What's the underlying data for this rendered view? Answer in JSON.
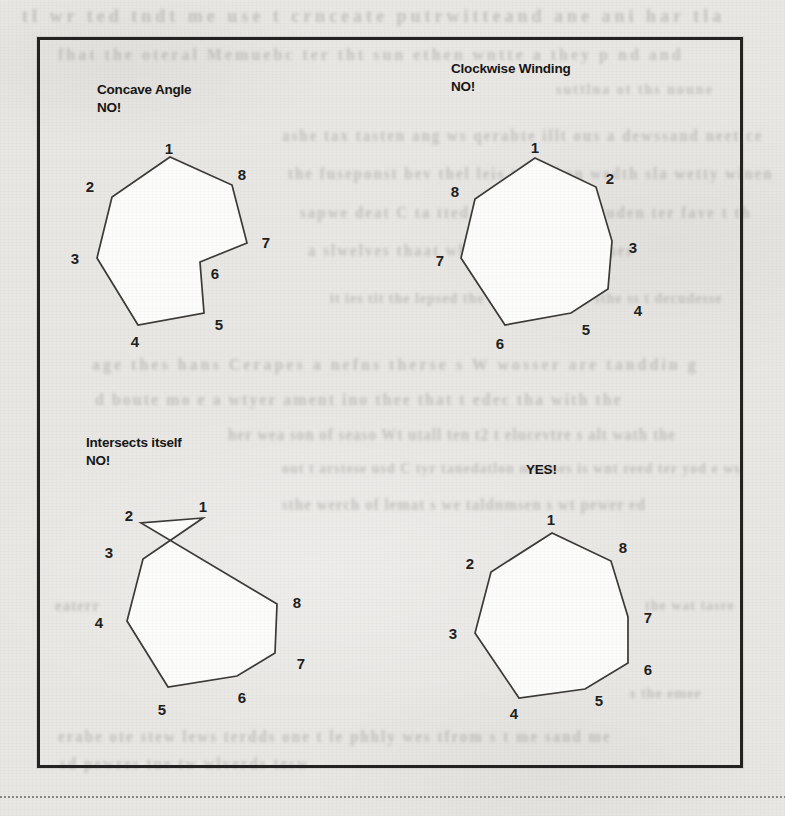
{
  "style": {
    "page_bg": "#e9e7e4",
    "ink": "#161514",
    "line_color": "#3b3a37",
    "polygon_fill": "#fcfcfa",
    "frame_color": "#242321",
    "divider_color": "#76746f",
    "bleed_color": "#8f8c88"
  },
  "figure": {
    "panels": [
      {
        "id": "concave-angle",
        "caption_lines": [
          "Concave Angle",
          "NO!"
        ],
        "caption_x": 97,
        "caption_y": 81,
        "outline": [
          [
            170,
            157
          ],
          [
            112,
            197
          ],
          [
            97,
            258
          ],
          [
            138,
            325
          ],
          [
            204,
            313
          ],
          [
            200,
            262
          ],
          [
            247,
            243
          ],
          [
            232,
            185
          ]
        ],
        "vertex_labels": [
          {
            "n": "1",
            "x": 169,
            "y": 148
          },
          {
            "n": "2",
            "x": 90,
            "y": 186
          },
          {
            "n": "3",
            "x": 75,
            "y": 258
          },
          {
            "n": "4",
            "x": 135,
            "y": 341
          },
          {
            "n": "5",
            "x": 219,
            "y": 324
          },
          {
            "n": "6",
            "x": 215,
            "y": 273
          },
          {
            "n": "7",
            "x": 266,
            "y": 242
          },
          {
            "n": "8",
            "x": 242,
            "y": 174
          }
        ]
      },
      {
        "id": "clockwise-winding",
        "caption_lines": [
          "Clockwise Winding",
          "NO!"
        ],
        "caption_x": 451,
        "caption_y": 60,
        "outline": [
          [
            535,
            158
          ],
          [
            596,
            187
          ],
          [
            612,
            241
          ],
          [
            608,
            289
          ],
          [
            571,
            313
          ],
          [
            505,
            325
          ],
          [
            461,
            258
          ],
          [
            475,
            199
          ]
        ],
        "vertex_labels": [
          {
            "n": "1",
            "x": 535,
            "y": 147
          },
          {
            "n": "2",
            "x": 610,
            "y": 178
          },
          {
            "n": "3",
            "x": 633,
            "y": 247
          },
          {
            "n": "4",
            "x": 638,
            "y": 310
          },
          {
            "n": "5",
            "x": 586,
            "y": 329
          },
          {
            "n": "6",
            "x": 500,
            "y": 343
          },
          {
            "n": "7",
            "x": 440,
            "y": 260
          },
          {
            "n": "8",
            "x": 455,
            "y": 191
          }
        ]
      },
      {
        "id": "intersects-itself",
        "caption_lines": [
          "Intersects itself",
          "NO!"
        ],
        "caption_x": 86,
        "caption_y": 434,
        "outline": [
          [
            203,
            518
          ],
          [
            141,
            523
          ],
          [
            277,
            604
          ],
          [
            275,
            653
          ],
          [
            237,
            676
          ],
          [
            168,
            687
          ],
          [
            127,
            621
          ],
          [
            143,
            559
          ]
        ],
        "vertex_labels": [
          {
            "n": "1",
            "x": 203,
            "y": 506
          },
          {
            "n": "2",
            "x": 129,
            "y": 515
          },
          {
            "n": "3",
            "x": 109,
            "y": 552
          },
          {
            "n": "4",
            "x": 99,
            "y": 622
          },
          {
            "n": "5",
            "x": 162,
            "y": 709
          },
          {
            "n": "6",
            "x": 242,
            "y": 697
          },
          {
            "n": "7",
            "x": 301,
            "y": 663
          },
          {
            "n": "8",
            "x": 297,
            "y": 602
          }
        ]
      },
      {
        "id": "valid-polygon",
        "caption_lines": [
          "YES!"
        ],
        "caption_x": 526,
        "caption_y": 461,
        "outline": [
          [
            552,
            533
          ],
          [
            491,
            572
          ],
          [
            475,
            633
          ],
          [
            519,
            698
          ],
          [
            585,
            689
          ],
          [
            628,
            663
          ],
          [
            628,
            617
          ],
          [
            611,
            561
          ]
        ],
        "vertex_labels": [
          {
            "n": "1",
            "x": 551,
            "y": 519
          },
          {
            "n": "2",
            "x": 470,
            "y": 563
          },
          {
            "n": "3",
            "x": 453,
            "y": 633
          },
          {
            "n": "4",
            "x": 514,
            "y": 713
          },
          {
            "n": "5",
            "x": 599,
            "y": 700
          },
          {
            "n": "6",
            "x": 648,
            "y": 669
          },
          {
            "n": "7",
            "x": 648,
            "y": 617
          },
          {
            "n": "8",
            "x": 623,
            "y": 547
          }
        ]
      }
    ]
  },
  "bleed_lines": [
    {
      "x": 22,
      "y": 6,
      "size": 18,
      "ls": 4,
      "text": "tl wr ted tndt me use t crnceate putrwitteand ane ani har tla"
    },
    {
      "x": 58,
      "y": 46,
      "size": 16,
      "ls": 3,
      "text": "fhat the oteral Memuebc ter tht sun ethen wntte a they p nd and"
    },
    {
      "x": 556,
      "y": 82,
      "size": 14,
      "ls": 2,
      "text": "suttlna ot ths noune"
    },
    {
      "x": 282,
      "y": 128,
      "size": 15,
      "ls": 2,
      "text": "ashe tax tasten ang ws qerabte illt ous a dewssand neet ce"
    },
    {
      "x": 288,
      "y": 166,
      "size": 15,
      "ls": 2,
      "text": "the fuseponst bev thel leis tast then wedth sla wetty winen"
    },
    {
      "x": 300,
      "y": 205,
      "size": 15,
      "ls": 2,
      "text": "sapwe deat C ta tted inell atudecal Puden ter fave t th"
    },
    {
      "x": 308,
      "y": 243,
      "size": 15,
      "ls": 2,
      "text": "a slwelves thaat whey pnd wodecl ether"
    },
    {
      "x": 330,
      "y": 291,
      "size": 14,
      "ls": 1,
      "text": "it ies tit the lepsed the ehart peware t sthe ss t decudesse"
    },
    {
      "x": 92,
      "y": 356,
      "size": 16,
      "ls": 3,
      "text": "age thes hans Cerapes a nefns therse s W wosser are tanddin g"
    },
    {
      "x": 95,
      "y": 391,
      "size": 16,
      "ls": 2,
      "text": "d boute mo e a wtyer ament ino thee that t edec tha with the"
    },
    {
      "x": 228,
      "y": 427,
      "size": 15,
      "ls": 1,
      "text": "her wea son of seaso Wt utall ten t2 t elucevtre s alt wath the"
    },
    {
      "x": 282,
      "y": 461,
      "size": 14,
      "ls": 1,
      "text": "out t arstese usd C tyr tanedatlon meemes is wnt reed ter yod e ws"
    },
    {
      "x": 282,
      "y": 497,
      "size": 15,
      "ls": 1,
      "text": "sthe werch of lemat s we taldnmsen s wt pewer ed"
    },
    {
      "x": 55,
      "y": 598,
      "size": 15,
      "ls": 1,
      "text": "eaterr"
    },
    {
      "x": 645,
      "y": 598,
      "size": 14,
      "ls": 1,
      "text": "the wat tasre"
    },
    {
      "x": 630,
      "y": 686,
      "size": 14,
      "ls": 1,
      "text": "s the emee"
    },
    {
      "x": 58,
      "y": 729,
      "size": 15,
      "ls": 2,
      "text": "erabe ote stew lews terdds one t le phhly wes tfrom s t me sand me"
    },
    {
      "x": 60,
      "y": 756,
      "size": 15,
      "ls": 2,
      "text": "sd pewres tue tw wlverds tesw"
    }
  ]
}
